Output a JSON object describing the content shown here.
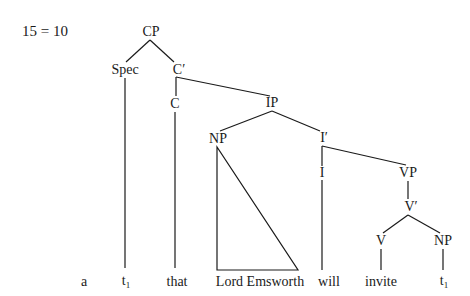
{
  "example_number": "15 = 10",
  "nodes": {
    "cp": "CP",
    "spec": "Spec",
    "c_bar": "C′",
    "c": "C",
    "ip": "IP",
    "np_subject": "NP",
    "i_bar": "I′",
    "i": "I",
    "vp": "VP",
    "v_bar": "V′",
    "v": "V",
    "np_object": "NP"
  },
  "terminals": {
    "label": "a",
    "trace1": "t",
    "trace1_sub": "1",
    "that": "that",
    "lord": "Lord Emsworth",
    "will": "will",
    "invite": "invite",
    "trace2": "t",
    "trace2_sub": "1"
  }
}
